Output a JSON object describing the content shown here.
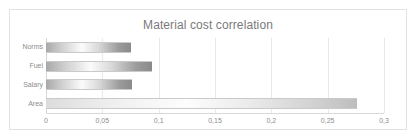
{
  "chart_data": {
    "type": "bar",
    "orientation": "horizontal",
    "title": "Material cost correlation",
    "xlabel": "",
    "ylabel": "",
    "categories": [
      "Norms",
      "Fuel",
      "Salary",
      "Area"
    ],
    "values": [
      0.075,
      0.094,
      0.076,
      0.276
    ],
    "xlim": [
      0,
      0.3
    ],
    "xticks": [
      0,
      0.05,
      0.1,
      0.15,
      0.2,
      0.25,
      0.3
    ],
    "xtick_labels": [
      "0",
      "0,05",
      "0,1",
      "0,15",
      "0,2",
      "0,25",
      "0,3"
    ],
    "grid": true,
    "grid_axis": "x",
    "legend": false,
    "series": [
      {
        "name": "Material cost correlation",
        "values": [
          0.075,
          0.094,
          0.076,
          0.276
        ]
      }
    ],
    "bar_fill": "gray-gradient",
    "colors": {
      "title": "#7a7a7a",
      "tick": "#8c8c8c",
      "grid": "#e9e9e9",
      "axis": "#d8d8d8",
      "frame": "#e3e3e3",
      "background": "#ffffff"
    }
  }
}
